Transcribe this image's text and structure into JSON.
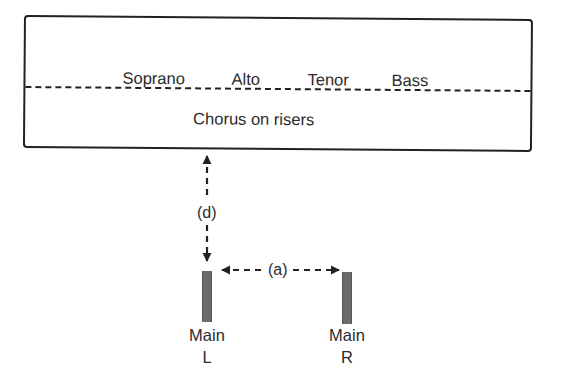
{
  "diagram": {
    "chorus_area": {
      "voice_sections": [
        "Soprano",
        "Alto",
        "Tenor",
        "Bass"
      ],
      "label": "Chorus on risers",
      "divider_style": "dashed"
    },
    "speakers": [
      {
        "name_line1": "Main",
        "name_line2": "L",
        "color": "#6b6b6b"
      },
      {
        "name_line1": "Main",
        "name_line2": "R",
        "color": "#6b6b6b"
      }
    ],
    "distances": {
      "vertical_label": "(d)",
      "horizontal_label": "(a)"
    },
    "colors": {
      "line": "#222222",
      "text": "#2b2b2b",
      "speaker": "#6b6b6b",
      "background": "#ffffff"
    }
  }
}
